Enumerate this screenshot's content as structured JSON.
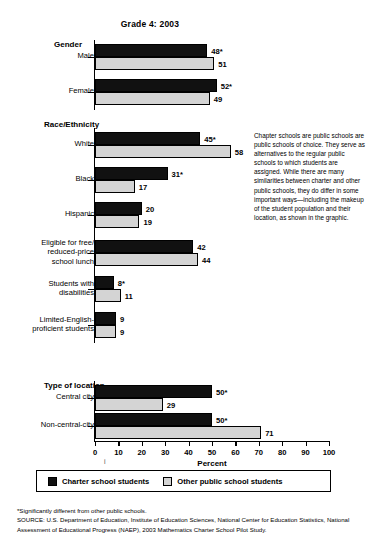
{
  "chart_data": {
    "type": "bar",
    "orientation": "horizontal",
    "title": "Grade 4: 2003",
    "xlabel": "Percent",
    "ylabel": "",
    "xlim": [
      0,
      100
    ],
    "xticks": [
      0,
      10,
      20,
      30,
      40,
      50,
      60,
      70,
      80,
      90,
      100
    ],
    "grid": false,
    "legend_position": "bottom",
    "series": [
      {
        "name": "Charter school students",
        "color": "#111111"
      },
      {
        "name": "Other public school students",
        "color": "#d4d4d4"
      }
    ],
    "groups": [
      {
        "header": "Gender",
        "categories": [
          {
            "label": "Male",
            "charter": {
              "value": 48,
              "label": "48*",
              "significant": true
            },
            "other": {
              "value": 51,
              "label": "51",
              "significant": false
            }
          },
          {
            "label": "Female",
            "charter": {
              "value": 52,
              "label": "52*",
              "significant": true
            },
            "other": {
              "value": 49,
              "label": "49",
              "significant": false
            }
          }
        ]
      },
      {
        "header": "Race/Ethnicity",
        "categories": [
          {
            "label": "White",
            "charter": {
              "value": 45,
              "label": "45*",
              "significant": true
            },
            "other": {
              "value": 58,
              "label": "58",
              "significant": false
            }
          },
          {
            "label": "Black",
            "charter": {
              "value": 31,
              "label": "31*",
              "significant": true
            },
            "other": {
              "value": 17,
              "label": "17",
              "significant": false
            }
          },
          {
            "label": "Hispanic",
            "charter": {
              "value": 20,
              "label": "20",
              "significant": false
            },
            "other": {
              "value": 19,
              "label": "19",
              "significant": false
            }
          },
          {
            "label": "Eligible for free/\nreduced-price\nschool lunch",
            "charter": {
              "value": 42,
              "label": "42",
              "significant": false
            },
            "other": {
              "value": 44,
              "label": "44",
              "significant": false
            }
          },
          {
            "label": "Students with\ndisabilities",
            "charter": {
              "value": 8,
              "label": "8*",
              "significant": true
            },
            "other": {
              "value": 11,
              "label": "11",
              "significant": false
            }
          },
          {
            "label": "Limited-English-\nproficient students",
            "charter": {
              "value": 9,
              "label": "9",
              "significant": false
            },
            "other": {
              "value": 9,
              "label": "9",
              "significant": false
            }
          }
        ]
      },
      {
        "header": "Type of location",
        "categories": [
          {
            "label": "Central city",
            "charter": {
              "value": 50,
              "label": "50*",
              "significant": true
            },
            "other": {
              "value": 29,
              "label": "29",
              "significant": false
            }
          },
          {
            "label": "Non-central-city",
            "charter": {
              "value": 50,
              "label": "50*",
              "significant": true
            },
            "other": {
              "value": 71,
              "label": "71",
              "significant": false
            }
          }
        ]
      }
    ]
  },
  "side_note": {
    "text": "Chapter schools are public schools are public schools of choice. They serve as alternatives to the regular public schools to which students are assigned. While there are many similarities between charter and other public schools, they do differ in some important ways—including the makeup of the student population and their location, as shown in the graphic."
  },
  "legend": {
    "items": [
      {
        "label": "Charter school students",
        "color": "#111111"
      },
      {
        "label": "Other public school students",
        "color": "#d4d4d4"
      }
    ]
  },
  "footnotes": {
    "significance": "*Significantly different from other public schools.",
    "source": "SOURCE: U.S. Department of Education, Institute of Education Sciences, National Center for Education Statistics, National Assessment of Educational Progress (NAEP), 2003 Mathematics Charter School Pilot Study."
  }
}
